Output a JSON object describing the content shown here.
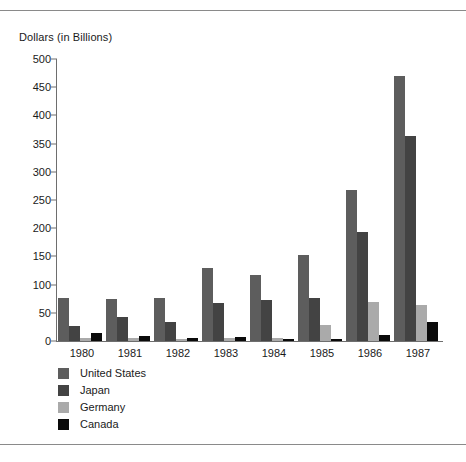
{
  "chart_data": {
    "type": "bar",
    "title": "",
    "ylabel": "Dollars (in Billions)",
    "xlabel": "",
    "ylim": [
      0,
      500
    ],
    "yticks": [
      0,
      50,
      100,
      150,
      200,
      250,
      300,
      350,
      400,
      450,
      500
    ],
    "grid": false,
    "legend_position": "below-left",
    "categories": [
      "1980",
      "1981",
      "1982",
      "1983",
      "1984",
      "1985",
      "1986",
      "1987"
    ],
    "series": [
      {
        "name": "United States",
        "color": "#5d5d5d",
        "values": [
          77,
          75,
          77,
          130,
          117,
          152,
          268,
          470
        ]
      },
      {
        "name": "Japan",
        "color": "#434343",
        "values": [
          27,
          42,
          33,
          68,
          73,
          76,
          193,
          363
        ]
      },
      {
        "name": "Germany",
        "color": "#aaaaaa",
        "values": [
          6,
          5,
          4,
          5,
          5,
          29,
          70,
          64
        ]
      },
      {
        "name": "Canada",
        "color": "#0a0a0a",
        "values": [
          15,
          9,
          5,
          8,
          4,
          4,
          10,
          33
        ]
      }
    ]
  },
  "axis_title": "Dollars (in Billions)"
}
